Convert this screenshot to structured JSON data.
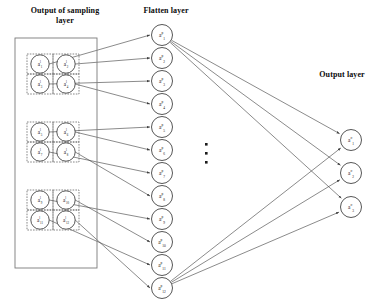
{
  "diagram": {
    "title_labels": {
      "sampling": "Output of sampling\nlayer",
      "flatten": "Flatten layer",
      "output": "Output layer"
    },
    "ellipsis": "·",
    "colors": {
      "stroke": "#3d3d3d",
      "node_stroke": "#2b2b2b",
      "dashed_stroke": "#555555",
      "box_stroke": "#7a7a7a",
      "text": "#111111",
      "background": "#ffffff"
    },
    "sampling_layer": {
      "outer_box": {
        "x": 15,
        "y": 38,
        "w": 82,
        "h": 230
      },
      "blocks": [
        {
          "name": "sampling-block-1",
          "x": 27,
          "y": 54,
          "w": 52,
          "h": 40,
          "nodes": [
            {
              "label": "a",
              "sup": "l",
              "sub": "1"
            },
            {
              "label": "a",
              "sup": "l",
              "sub": "2"
            },
            {
              "label": "a",
              "sup": "l",
              "sub": "3"
            },
            {
              "label": "a",
              "sup": "l",
              "sub": "4"
            }
          ]
        },
        {
          "name": "sampling-block-2",
          "x": 27,
          "y": 122,
          "w": 52,
          "h": 40,
          "nodes": [
            {
              "label": "a",
              "sup": "l",
              "sub": "5"
            },
            {
              "label": "a",
              "sup": "l",
              "sub": "6"
            },
            {
              "label": "a",
              "sup": "l",
              "sub": "7"
            },
            {
              "label": "a",
              "sup": "l",
              "sub": "8"
            }
          ]
        },
        {
          "name": "sampling-block-3",
          "x": 27,
          "y": 190,
          "w": 52,
          "h": 40,
          "nodes": [
            {
              "label": "a",
              "sup": "l",
              "sub": "9"
            },
            {
              "label": "a",
              "sup": "l",
              "sub": "10"
            },
            {
              "label": "a",
              "sup": "l",
              "sub": "11"
            },
            {
              "label": "a",
              "sup": "l",
              "sub": "12"
            }
          ]
        }
      ]
    },
    "flatten_layer": {
      "cx": 162,
      "r": 10.5,
      "nodes": [
        {
          "cy": 35,
          "label": "a",
          "sup": "p",
          "sub": "1"
        },
        {
          "cy": 58,
          "label": "a",
          "sup": "p",
          "sub": "2"
        },
        {
          "cy": 81,
          "label": "a",
          "sup": "p",
          "sub": "3"
        },
        {
          "cy": 104,
          "label": "a",
          "sup": "p",
          "sub": "4"
        },
        {
          "cy": 127,
          "label": "a",
          "sup": "p",
          "sub": "5"
        },
        {
          "cy": 150,
          "label": "a",
          "sup": "p",
          "sub": "6"
        },
        {
          "cy": 173,
          "label": "a",
          "sup": "p",
          "sub": "7"
        },
        {
          "cy": 196,
          "label": "a",
          "sup": "p",
          "sub": "8"
        },
        {
          "cy": 219,
          "label": "a",
          "sup": "p",
          "sub": "9"
        },
        {
          "cy": 242,
          "label": "a",
          "sup": "p",
          "sub": "10"
        },
        {
          "cy": 265,
          "label": "a",
          "sup": "p",
          "sub": "11"
        },
        {
          "cy": 288,
          "label": "a",
          "sup": "p",
          "sub": "12"
        }
      ]
    },
    "output_layer": {
      "cx": 351,
      "r": 10.5,
      "nodes": [
        {
          "cy": 140,
          "label": "a",
          "sup": "o",
          "sub": "1"
        },
        {
          "cy": 173,
          "label": "a",
          "sup": "o",
          "sub": "2"
        },
        {
          "cy": 207,
          "label": "a",
          "sup": "o",
          "sub": "3"
        }
      ]
    }
  }
}
